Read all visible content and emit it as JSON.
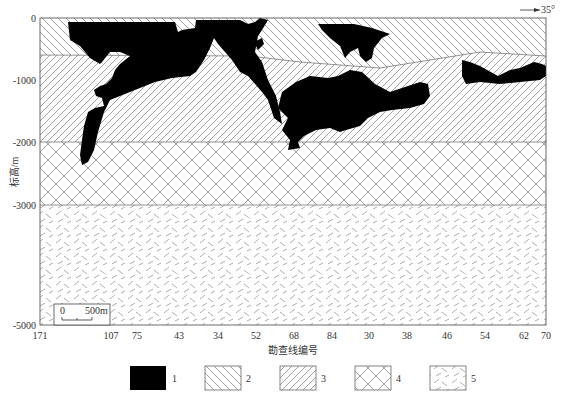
{
  "figure": {
    "orientation_label": "35°",
    "y_axis": {
      "label": "标高/m",
      "ticks": [
        {
          "value": "0",
          "y": 18
        },
        {
          "value": "-1000",
          "y": 80
        },
        {
          "value": "-2000",
          "y": 142
        },
        {
          "value": "-3000",
          "y": 205
        },
        {
          "value": "-5000",
          "y": 325
        }
      ]
    },
    "x_axis": {
      "label": "勘查线编号",
      "ticks": [
        {
          "value": "171",
          "x": 40
        },
        {
          "value": "107",
          "x": 111
        },
        {
          "value": "75",
          "x": 137
        },
        {
          "value": "43",
          "x": 179
        },
        {
          "value": "34",
          "x": 218
        },
        {
          "value": "52",
          "x": 256
        },
        {
          "value": "68",
          "x": 294
        },
        {
          "value": "84",
          "x": 332
        },
        {
          "value": "30",
          "x": 369
        },
        {
          "value": "38",
          "x": 407
        },
        {
          "value": "46",
          "x": 447
        },
        {
          "value": "54",
          "x": 485
        },
        {
          "value": "62",
          "x": 524
        },
        {
          "value": "70",
          "x": 563
        }
      ]
    },
    "scale_bar": {
      "start": "0",
      "end": "500m"
    },
    "legend": [
      {
        "id": "1",
        "label": "1",
        "pattern": "solid-black"
      },
      {
        "id": "2",
        "label": "2",
        "pattern": "backslash-hatch"
      },
      {
        "id": "3",
        "label": "3",
        "pattern": "slash-hatch"
      },
      {
        "id": "4",
        "label": "4",
        "pattern": "cross-hatch"
      },
      {
        "id": "5",
        "label": "5",
        "pattern": "dashed-dots"
      }
    ]
  }
}
